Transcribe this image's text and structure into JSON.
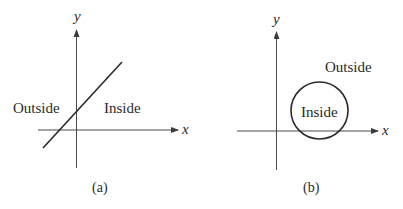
{
  "colors": {
    "ink": "#2a2a2a",
    "axis": "#4a4a4a",
    "background": "#ffffff"
  },
  "panels": [
    {
      "id": "a",
      "caption": "(a)",
      "axes": {
        "x_label": "x",
        "y_label": "y"
      },
      "boundary": {
        "shape": "line"
      },
      "regions": {
        "outside": "Outside",
        "inside": "Inside"
      }
    },
    {
      "id": "b",
      "caption": "(b)",
      "axes": {
        "x_label": "x",
        "y_label": "y"
      },
      "boundary": {
        "shape": "circle"
      },
      "regions": {
        "outside": "Outside",
        "inside": "Inside"
      }
    }
  ]
}
